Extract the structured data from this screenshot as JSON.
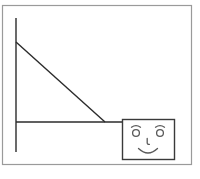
{
  "canvas": {
    "width": 200,
    "height": 179,
    "background_color": "#ffffff",
    "description": "Simple black-and-white line drawing: an outer rectangular frame containing a right-angle axis with a diagonal hypotenuse, plus a small rectangle holding a cartoon smiley face."
  },
  "style": {
    "outer_border_color": "#9a9a9a",
    "outer_border_width": 1.2,
    "line_color": "#2b2b2b",
    "line_width": 1.4,
    "face_box_color": "#3a3a3a",
    "face_box_width": 1.4,
    "face_feature_color": "#5a5a5a",
    "face_feature_width": 1.3
  },
  "shapes": {
    "outer_frame": {
      "label": "Outer frame",
      "x": 2.5,
      "y": 5.5,
      "width": 189,
      "height": 159
    },
    "vertical_line": {
      "label": "Vertical line",
      "x1": 16,
      "y1": 18,
      "x2": 16,
      "y2": 152
    },
    "horizontal_line": {
      "label": "Horizontal line",
      "x1": 16,
      "y1": 122,
      "x2": 125,
      "y2": 122
    },
    "diagonal_line": {
      "label": "Diagonal line",
      "x1": 16,
      "y1": 42,
      "x2": 105,
      "y2": 122
    },
    "face_box": {
      "label": "Face box",
      "x": 122.5,
      "y": 119.5,
      "width": 52,
      "height": 40
    }
  },
  "face": {
    "label": "Smiley face",
    "left_eye": {
      "cx": 136,
      "cy": 133,
      "r": 3.4
    },
    "right_eye": {
      "cx": 160,
      "cy": 133,
      "r": 3.4
    },
    "left_eyebrow": {
      "path": "M 131.5 127.2 Q 136 124.0 140.5 127.2"
    },
    "right_eyebrow": {
      "path": "M 155.5 127.2 Q 160 124.0 164.5 127.2"
    },
    "nose": {
      "path": "M 147.2 138.5 L 147.2 143.0 Q 147.4 144.6 149.4 144.3"
    },
    "mouth": {
      "path": "M 138.5 148.5 Q 148 157.5 157.5 148.5"
    }
  }
}
